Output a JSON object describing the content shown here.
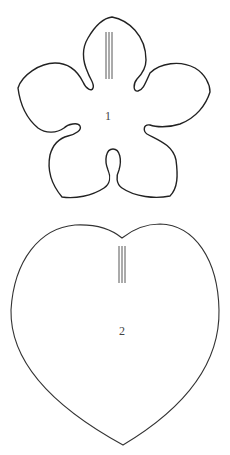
{
  "diagram": {
    "type": "sewing-pattern-templates",
    "pieces": [
      {
        "id": "piece-1",
        "shape": "five-petal-flower",
        "label": "1",
        "grainline": "triple vertical lines"
      },
      {
        "id": "piece-2",
        "shape": "heart",
        "label": "2",
        "grainline": "triple vertical lines"
      }
    ],
    "colors": {
      "line": "#222222",
      "background": "#ffffff"
    }
  }
}
